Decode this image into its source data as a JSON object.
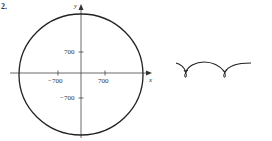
{
  "figure_label": "2.",
  "left_plot": {
    "type": "polar circle graph",
    "x_axis_label": "x",
    "y_axis_label": "y",
    "x_ticks": [
      "−700",
      "700"
    ],
    "y_ticks": [
      "700",
      "−700"
    ]
  },
  "right_plot": {
    "type": "trochoid-like curve with loops",
    "description": "two arches with small loops at cusps"
  },
  "colors": {
    "line": "#222222",
    "axis": "#444444",
    "background": "#ffffff"
  }
}
